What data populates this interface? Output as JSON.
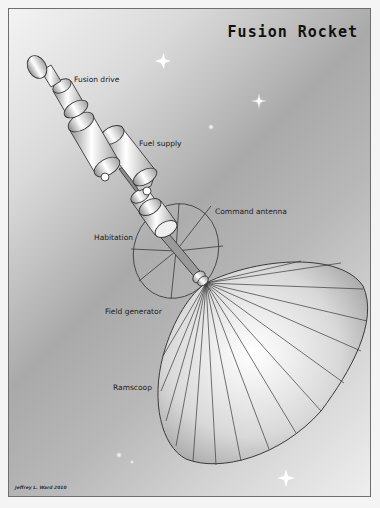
{
  "title": "Fusion Rocket",
  "labels": {
    "fusion_drive": "Fusion drive",
    "fuel_supply": "Fuel supply",
    "command_antenna": "Command antenna",
    "habitation": "Habitation",
    "field_generator": "Field generator",
    "ramscoop": "Ramscoop"
  },
  "credit": "Jeffrey L. Ward 2010",
  "colors": {
    "frame_border": "#6e6e6e",
    "text": "#222222",
    "outline": "#3a3a3a"
  }
}
